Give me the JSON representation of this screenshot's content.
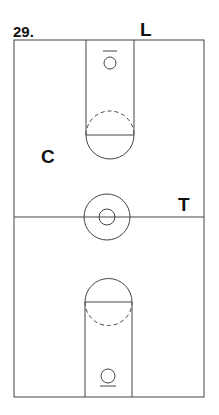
{
  "diagram": {
    "number": "29.",
    "type": "basketball-full-court",
    "line_color": "#444444",
    "players": [
      {
        "label": "L",
        "position": "top-right baseline"
      },
      {
        "label": "C",
        "position": "left wing, top half"
      },
      {
        "label": "T",
        "position": "right side near half-court line"
      }
    ]
  }
}
